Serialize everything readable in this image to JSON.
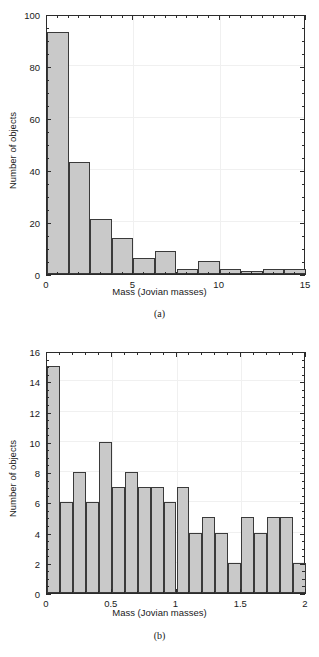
{
  "figure": {
    "panels": [
      {
        "id": "a",
        "caption": "(a)",
        "chart_data": {
          "type": "bar",
          "title": "",
          "xlabel": "Mass (Jovian masses)",
          "ylabel": "Number of objects",
          "xlim": [
            0,
            15
          ],
          "ylim": [
            0,
            100
          ],
          "xticks": [
            0,
            5,
            10,
            15
          ],
          "xticklabels": [
            "0",
            "5",
            "10",
            "15"
          ],
          "yticks": [
            0,
            20,
            40,
            60,
            80,
            100
          ],
          "yticklabels": [
            "0",
            "20",
            "40",
            "60",
            "80",
            "100"
          ],
          "minor_xtick_interval": 0.625,
          "minor_ytick_interval": 5,
          "grid": true,
          "legend": "none",
          "bin_width": 1.25,
          "bin_edges": [
            0,
            1.25,
            2.5,
            3.75,
            5,
            6.25,
            7.5,
            8.75,
            10,
            11.25,
            12.5,
            13.75,
            15
          ],
          "categories": [
            "0–1.25",
            "1.25–2.5",
            "2.5–3.75",
            "3.75–5",
            "5–6.25",
            "6.25–7.5",
            "7.5–8.75",
            "8.75–10",
            "10–11.25",
            "11.25–12.5",
            "12.5–13.75",
            "13.75–15"
          ],
          "values": [
            93,
            43,
            21,
            14,
            6,
            9,
            2,
            5,
            2,
            1,
            2,
            2
          ],
          "bar_fill": "#c9c9c9",
          "bar_edge": "#3a3a3a"
        }
      },
      {
        "id": "b",
        "caption": "(b)",
        "chart_data": {
          "type": "bar",
          "title": "",
          "xlabel": "Mass (Jovian masses)",
          "ylabel": "Number of objects",
          "xlim": [
            0,
            2
          ],
          "ylim": [
            0,
            16
          ],
          "xticks": [
            0,
            0.5,
            1,
            1.5,
            2
          ],
          "xticklabels": [
            "0",
            "0.5",
            "1",
            "1.5",
            "2"
          ],
          "yticks": [
            0,
            2,
            4,
            6,
            8,
            10,
            12,
            14,
            16
          ],
          "yticklabels": [
            "0",
            "2",
            "4",
            "6",
            "8",
            "10",
            "12",
            "14",
            "16"
          ],
          "minor_xtick_interval": 0.1,
          "minor_ytick_interval": 0.5,
          "grid": true,
          "legend": "none",
          "bin_width": 0.1,
          "bin_edges": [
            0,
            0.1,
            0.2,
            0.3,
            0.4,
            0.5,
            0.6,
            0.7,
            0.8,
            0.9,
            1.0,
            1.1,
            1.2,
            1.3,
            1.4,
            1.5,
            1.6,
            1.7,
            1.8,
            1.9,
            2.0
          ],
          "categories": [
            "0–0.1",
            "0.1–0.2",
            "0.2–0.3",
            "0.3–0.4",
            "0.4–0.5",
            "0.5–0.6",
            "0.6–0.7",
            "0.7–0.8",
            "0.8–0.9",
            "0.9–1.0",
            "1.0–1.1",
            "1.1–1.2",
            "1.2–1.3",
            "1.3–1.4",
            "1.4–1.5",
            "1.5–1.6",
            "1.6–1.7",
            "1.7–1.8",
            "1.8–1.9",
            "1.9–2.0"
          ],
          "values": [
            15,
            6,
            8,
            6,
            10,
            7,
            8,
            7,
            7,
            6,
            7,
            4,
            5,
            4,
            2,
            5,
            4,
            5,
            5,
            2
          ],
          "bar_fill": "#c9c9c9",
          "bar_edge": "#3a3a3a"
        }
      }
    ]
  }
}
